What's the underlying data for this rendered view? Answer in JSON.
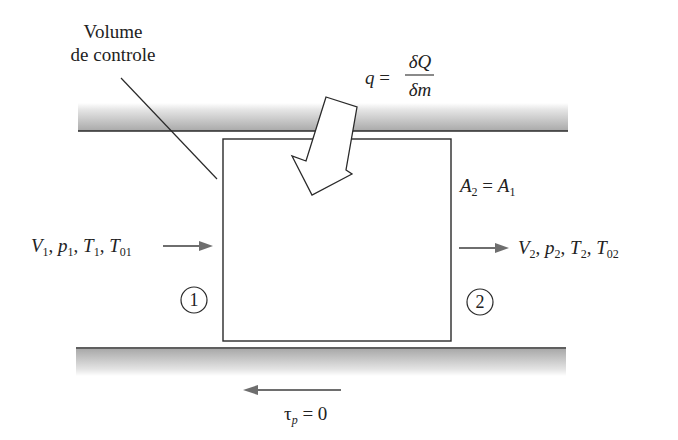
{
  "diagram": {
    "control_volume_label_line1": "Volume",
    "control_volume_label_line2": "de controle",
    "heat_label": {
      "lhs": "q",
      "eq": "=",
      "numerator": "δQ",
      "denominator": "δm"
    },
    "area_label": {
      "a2": "A",
      "a2_sub": "2",
      "eq": "=",
      "a1": "A",
      "a1_sub": "1"
    },
    "inlet": {
      "V": "V",
      "V_sub": "1",
      "p": "p",
      "p_sub": "1",
      "T": "T",
      "T_sub": "1",
      "T0": "T",
      "T0_sub": "01",
      "station": "1"
    },
    "outlet": {
      "V": "V",
      "V_sub": "2",
      "p": "p",
      "p_sub": "2",
      "T": "T",
      "T_sub": "2",
      "T0": "T",
      "T0_sub": "02",
      "station": "2"
    },
    "wall_shear_label": {
      "tau": "τ",
      "tau_sub": "p",
      "eq": "= 0"
    },
    "colors": {
      "line": "#2a2a2a",
      "flow_arrow": "#6e6e6e",
      "wall_shade_dark": "#a8a8a8",
      "wall_shade_light": "#ffffff"
    }
  }
}
